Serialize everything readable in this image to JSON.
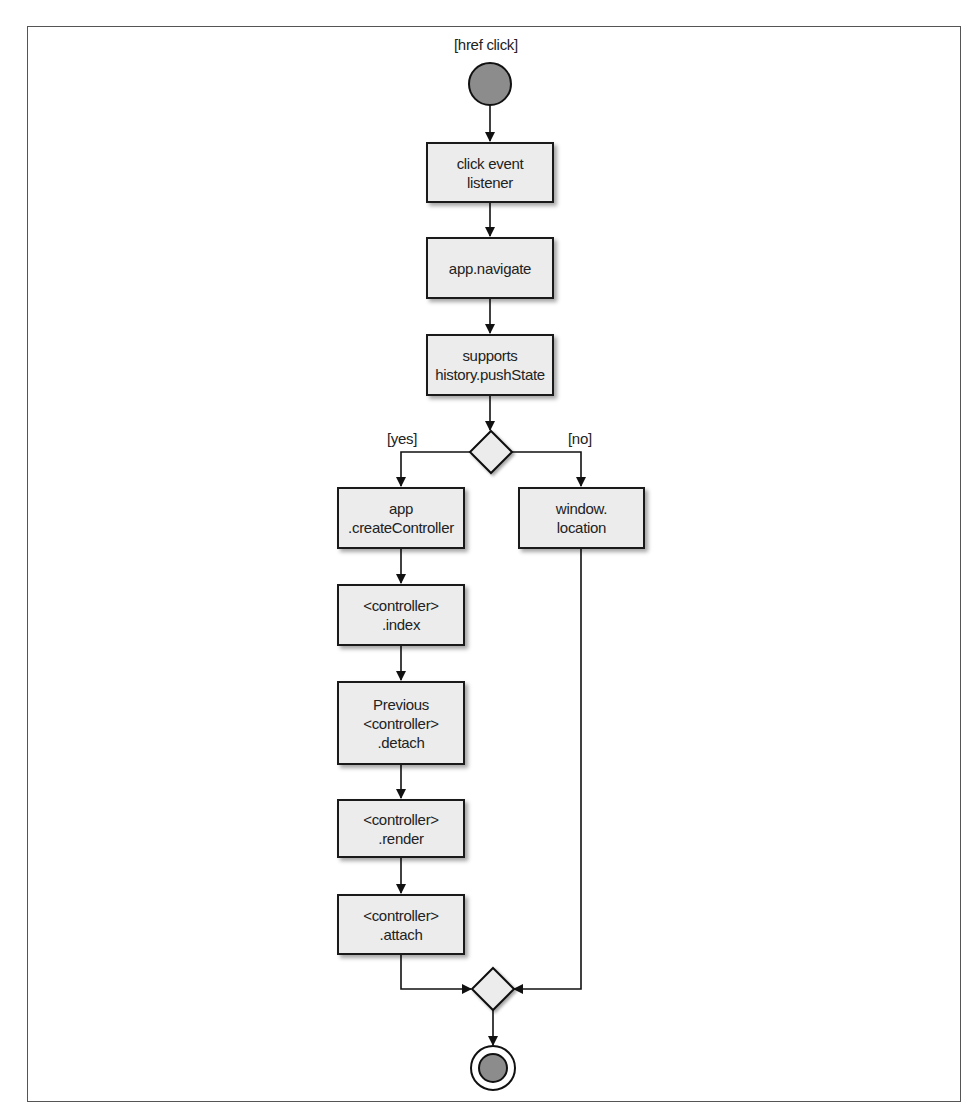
{
  "diagram": {
    "type": "activity-diagram",
    "start": {
      "label": "[href click]"
    },
    "nodes": [
      {
        "id": "n1",
        "text": "click event\nlistener"
      },
      {
        "id": "n2",
        "text": "app.navigate"
      },
      {
        "id": "n3",
        "text": "supports\nhistory.pushState"
      },
      {
        "id": "n4",
        "text": "app\n.createController"
      },
      {
        "id": "n5",
        "text": "window.\nlocation"
      },
      {
        "id": "n6",
        "text": "<controller>\n.index"
      },
      {
        "id": "n7",
        "text": "Previous\n<controller>\n.detach"
      },
      {
        "id": "n8",
        "text": "<controller>\n.render"
      },
      {
        "id": "n9",
        "text": "<controller>\n.attach"
      }
    ],
    "decision": {
      "branches": [
        {
          "label": "[yes]",
          "target": "n4"
        },
        {
          "label": "[no]",
          "target": "n5"
        }
      ]
    },
    "edges": [
      [
        "start",
        "n1"
      ],
      [
        "n1",
        "n2"
      ],
      [
        "n2",
        "n3"
      ],
      [
        "n3",
        "decision"
      ],
      [
        "decision",
        "n4"
      ],
      [
        "decision",
        "n5"
      ],
      [
        "n4",
        "n6"
      ],
      [
        "n6",
        "n7"
      ],
      [
        "n7",
        "n8"
      ],
      [
        "n8",
        "n9"
      ],
      [
        "n9",
        "merge"
      ],
      [
        "n5",
        "merge"
      ],
      [
        "merge",
        "end"
      ]
    ],
    "colors": {
      "node_fill": "#ececec",
      "stroke": "#1a1a1a",
      "start_fill": "#8c8c8c",
      "end_fill": "#8c8c8c"
    }
  }
}
